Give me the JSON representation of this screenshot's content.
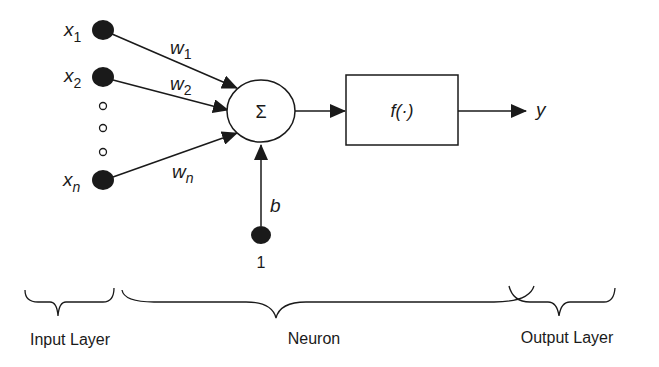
{
  "diagram": {
    "inputs": [
      {
        "name": "x",
        "sub": "1",
        "weight": "w",
        "weight_sub": "1"
      },
      {
        "name": "x",
        "sub": "2",
        "weight": "w",
        "weight_sub": "2"
      },
      {
        "name": "x",
        "sub": "n",
        "weight": "w",
        "weight_sub": "n"
      }
    ],
    "summation_symbol": "Σ",
    "activation_label": "f(·)",
    "output_label": "y",
    "bias_label": "b",
    "bias_input": "1",
    "sections": {
      "input": "Input Layer",
      "neuron": "Neuron",
      "output": "Output Layer"
    }
  }
}
